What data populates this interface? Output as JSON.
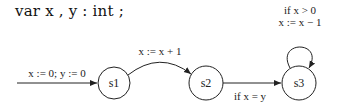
{
  "declaration": "var x , y : int ;",
  "states": [
    {
      "id": "s1",
      "label": "s1",
      "initial": true
    },
    {
      "id": "s2",
      "label": "s2"
    },
    {
      "id": "s3",
      "label": "s3"
    }
  ],
  "transitions": [
    {
      "from": null,
      "to": "s1",
      "label": "x := 0;  y := 0"
    },
    {
      "from": "s1",
      "to": "s2",
      "label": "x := x + 1"
    },
    {
      "from": "s2",
      "to": "s3",
      "label": "if x = y"
    },
    {
      "from": "s3",
      "to": "s3",
      "label_line1": "if x > 0",
      "label_line2": "x := x − 1"
    }
  ]
}
